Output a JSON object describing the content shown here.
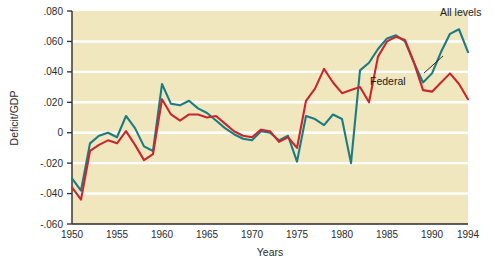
{
  "chart_data": {
    "type": "line",
    "title": "",
    "xlabel": "Years",
    "ylabel": "Deficit/GDP",
    "xlim": [
      1950,
      1994
    ],
    "ylim": [
      -0.06,
      0.08
    ],
    "grid": true,
    "grid_color": "#ffffff",
    "plot_background": "#f0e7bf",
    "legend_position": "inline-annotations",
    "xticks": [
      1950,
      1955,
      1960,
      1965,
      1970,
      1975,
      1980,
      1985,
      1990,
      1994
    ],
    "xtick_labels": [
      "1950",
      "1955",
      "1960",
      "1965",
      "1970",
      "1975",
      "1980",
      "1985",
      "1990",
      "1994"
    ],
    "yticks": [
      0.08,
      0.06,
      0.04,
      0.02,
      0,
      -0.02,
      -0.04,
      -0.06
    ],
    "ytick_labels": [
      ".080",
      ".060",
      ".040",
      ".020",
      "0",
      "-.020",
      "-.040",
      "-.060"
    ],
    "x": [
      1950,
      1951,
      1952,
      1953,
      1954,
      1955,
      1956,
      1957,
      1958,
      1959,
      1960,
      1961,
      1962,
      1963,
      1964,
      1965,
      1966,
      1967,
      1968,
      1969,
      1970,
      1971,
      1972,
      1973,
      1974,
      1975,
      1976,
      1977,
      1978,
      1979,
      1980,
      1981,
      1982,
      1983,
      1984,
      1985,
      1986,
      1987,
      1988,
      1989,
      1990,
      1991,
      1992,
      1993,
      1994
    ],
    "series": [
      {
        "name": "All levels",
        "color": "#1b7b82",
        "values": [
          -0.03,
          -0.038,
          -0.007,
          -0.002,
          0.0,
          -0.003,
          0.011,
          0.003,
          -0.009,
          -0.012,
          0.032,
          0.019,
          0.018,
          0.021,
          0.016,
          0.013,
          0.008,
          0.003,
          -0.001,
          -0.004,
          -0.005,
          0.001,
          0.0,
          -0.005,
          -0.002,
          -0.019,
          0.011,
          0.009,
          0.005,
          0.012,
          0.009,
          -0.02,
          0.041,
          0.046,
          0.055,
          0.062,
          0.064,
          0.06,
          0.046,
          0.033,
          0.039,
          0.053,
          0.065,
          0.068,
          0.053
        ]
      },
      {
        "name": "Federal",
        "color": "#c8272d",
        "values": [
          -0.036,
          -0.044,
          -0.012,
          -0.008,
          -0.005,
          -0.007,
          0.001,
          -0.008,
          -0.018,
          -0.014,
          0.022,
          0.012,
          0.008,
          0.012,
          0.012,
          0.01,
          0.011,
          0.006,
          0.001,
          -0.002,
          -0.003,
          0.002,
          0.001,
          -0.006,
          -0.003,
          -0.01,
          0.021,
          0.029,
          0.042,
          0.033,
          0.026,
          0.028,
          0.03,
          0.02,
          0.05,
          0.06,
          0.063,
          0.061,
          0.046,
          0.028,
          0.027,
          0.033,
          0.039,
          0.032,
          0.022
        ]
      }
    ],
    "annotations": [
      {
        "text": "All levels",
        "series": "All levels",
        "x": 440,
        "y": 16
      },
      {
        "text": "Federal",
        "series": "Federal",
        "x": 396,
        "y": 81
      }
    ]
  },
  "axes": {
    "x_title": "Years",
    "y_title": "Deficit/GDP"
  }
}
